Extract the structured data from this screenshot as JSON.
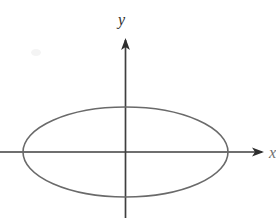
{
  "figure": {
    "background_color": "#ffffff",
    "width": 276,
    "height": 218
  },
  "axes": {
    "x_label": "x",
    "y_label": "y",
    "axis_color": "#3f3f3f",
    "axis_stroke_width": 1.6,
    "origin": {
      "x": 125.5,
      "y": 152
    },
    "x_axis": {
      "start_x": 0,
      "end_x": 264,
      "y": 152,
      "arrow": "right"
    },
    "y_axis": {
      "x": 125.5,
      "start_y": 38,
      "end_y": 218,
      "arrow": "up"
    }
  },
  "chart_data": {
    "type": "line",
    "xlabel": "x",
    "ylabel": "y",
    "grid": false,
    "legend": null,
    "annotations": [],
    "xlim": [
      -125.5,
      150.5
    ],
    "ylim": [
      -66,
      114
    ],
    "series": [
      {
        "name": "ellipse",
        "shape": "ellipse",
        "center": [
          0,
          0
        ],
        "semi_major_axis_x": 102.5,
        "semi_minor_axis_y": 45,
        "stroke_color": "#6a6a6a",
        "stroke_width": 1.6,
        "fill": "none",
        "x_intercepts": [
          -102.5,
          102.5
        ],
        "y_intercepts": [
          -45,
          45
        ]
      }
    ]
  },
  "ellipse": {
    "center_px": {
      "x": 125.5,
      "y": 152
    },
    "radius_x_px": 102.5,
    "radius_y_px": 45,
    "stroke_color": "#6a6a6a",
    "stroke_width": 1.6,
    "left_vertex_px": {
      "x": 23,
      "y": 152
    },
    "right_vertex_px": {
      "x": 228,
      "y": 152
    },
    "top_vertex_px": {
      "x": 125.5,
      "y": 107
    },
    "bottom_vertex_px": {
      "x": 125.5,
      "y": 197
    }
  }
}
